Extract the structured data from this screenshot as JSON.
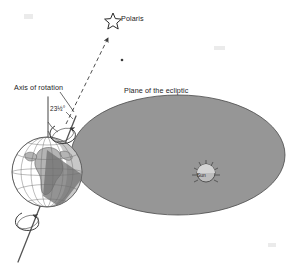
{
  "figure": {
    "background_color": "#ffffff",
    "ink_color": "#1d1d1d"
  },
  "labels": {
    "polaris": "Polaris",
    "axis_of_rotation": "Axis of rotation",
    "plane_of_the_ecliptic": "Plane of the ecliptic",
    "tilt_angle": "23½°",
    "sun": "Sun"
  },
  "icons": {
    "polaris_star": "star-outline-icon",
    "faint_star": "star-dot-icon",
    "sun_disc": "sun-icon",
    "earth_globe": "earth-globe-icon",
    "rotation_arrow_north": "curved-rotation-arrow-icon",
    "rotation_arrow_south": "curved-rotation-arrow-icon",
    "polaris_pointer": "dashed-arrow-icon"
  },
  "colors": {
    "ecliptic_fill": "#969696",
    "ecliptic_stroke": "#4a4a4a",
    "land_fill": "#b4b4b4",
    "ocean_fill": "#ffffff",
    "axis_line": "#555555",
    "vertical_reference_line": "#8a8a8a",
    "shadow_fill": "#777777",
    "text": "#1d1d1d"
  },
  "geometry": {
    "ecliptic_ellipse": {
      "center_x": 178,
      "center_y": 155,
      "radius_x": 107,
      "radius_y": 60
    },
    "earth": {
      "center_x": 47,
      "center_y": 172,
      "radius": 35
    },
    "sun": {
      "center_x": 206,
      "center_y": 173,
      "radius": 9
    },
    "axis_tilt_degrees": 23.5,
    "axis_top_x": 76,
    "axis_top_y": 116,
    "axis_bottom_x": 18,
    "axis_bottom_y": 262,
    "vertical_reference_x": 48,
    "vertical_reference_top_y": 97,
    "vertical_reference_bottom_y": 160,
    "polaris_star_x": 113,
    "polaris_star_y": 20,
    "faint_star_x": 122,
    "faint_star_y": 60,
    "dashed_arrow_start_x": 66,
    "dashed_arrow_start_y": 124,
    "dashed_arrow_end_x": 108,
    "dashed_arrow_end_y": 38
  }
}
